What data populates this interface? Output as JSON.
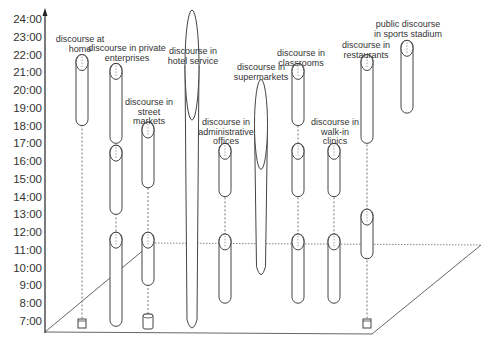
{
  "diagram": {
    "y_axis": {
      "labels": [
        "24:00",
        "23:00",
        "22:00",
        "21:00",
        "20:00",
        "19:00",
        "18:00",
        "17:00",
        "16:00",
        "15:00",
        "14:00",
        "13:00",
        "12:00",
        "11:00",
        "10:00",
        "9:00",
        "8:00",
        "7:00"
      ]
    },
    "columns": [
      {
        "id": "home",
        "label_lines": [
          "discourse at",
          "home"
        ],
        "x": 82,
        "label_x": 80,
        "label_y": 35,
        "segments": [
          [
            22.0,
            18.0
          ]
        ],
        "base": "small-box"
      },
      {
        "id": "private-enterprises",
        "label_lines": [
          "discourse in private",
          "enterprises"
        ],
        "x": 116,
        "label_x": 127,
        "label_y": 44,
        "segments": [
          [
            21.5,
            17.0
          ],
          [
            16.9,
            13.0
          ],
          [
            12.0,
            6.7
          ]
        ],
        "base": null
      },
      {
        "id": "street-markets",
        "label_lines": [
          "discourse in",
          "street",
          "markets"
        ],
        "x": 148,
        "label_x": 149,
        "label_y": 98,
        "segments": [
          [
            18.2,
            14.5
          ],
          [
            12.0,
            9.0
          ]
        ],
        "base": "cylinder"
      },
      {
        "id": "hotel-service",
        "label_lines": [
          "discourse in",
          "hotel service"
        ],
        "x": 192,
        "label_x": 193,
        "label_y": 47,
        "segments": [
          [
            24.5,
            6.5
          ]
        ],
        "base": null,
        "style": "ellipse"
      },
      {
        "id": "administrative-offices",
        "label_lines": [
          "discourse in",
          "administrative",
          "offices"
        ],
        "x": 225,
        "label_x": 226,
        "label_y": 118,
        "segments": [
          [
            17.0,
            14.0
          ],
          [
            11.9,
            8.0
          ]
        ],
        "base": null
      },
      {
        "id": "supermarkets",
        "label_lines": [
          "discourse in",
          "supermarkets"
        ],
        "x": 261,
        "label_x": 261,
        "label_y": 63,
        "segments": [
          [
            20.6,
            9.5
          ]
        ],
        "base": null,
        "style": "ellipse"
      },
      {
        "id": "classrooms",
        "label_lines": [
          "discourse in",
          "classrooms"
        ],
        "x": 298,
        "label_x": 301,
        "label_y": 49,
        "segments": [
          [
            21.5,
            18.0
          ],
          [
            17.0,
            14.0
          ],
          [
            11.9,
            8.0
          ]
        ],
        "base": null
      },
      {
        "id": "walk-in-clinics",
        "label_lines": [
          "discourse in",
          "walk-in",
          "clinics"
        ],
        "x": 334,
        "label_x": 335,
        "label_y": 118,
        "segments": [
          [
            17.0,
            14.0
          ],
          [
            11.9,
            8.0
          ]
        ],
        "base": null
      },
      {
        "id": "restaurants",
        "label_lines": [
          "discourse in",
          "restaurants"
        ],
        "x": 367,
        "label_x": 366,
        "label_y": 41,
        "segments": [
          [
            22.0,
            17.0
          ],
          [
            13.3,
            10.5
          ]
        ],
        "base": "small-box"
      },
      {
        "id": "sports-stadium",
        "label_lines": [
          "public discourse",
          "in sports stadium"
        ],
        "x": 407,
        "label_x": 408,
        "label_y": 20,
        "segments": [
          [
            22.8,
            18.7
          ]
        ],
        "base": null
      }
    ]
  }
}
